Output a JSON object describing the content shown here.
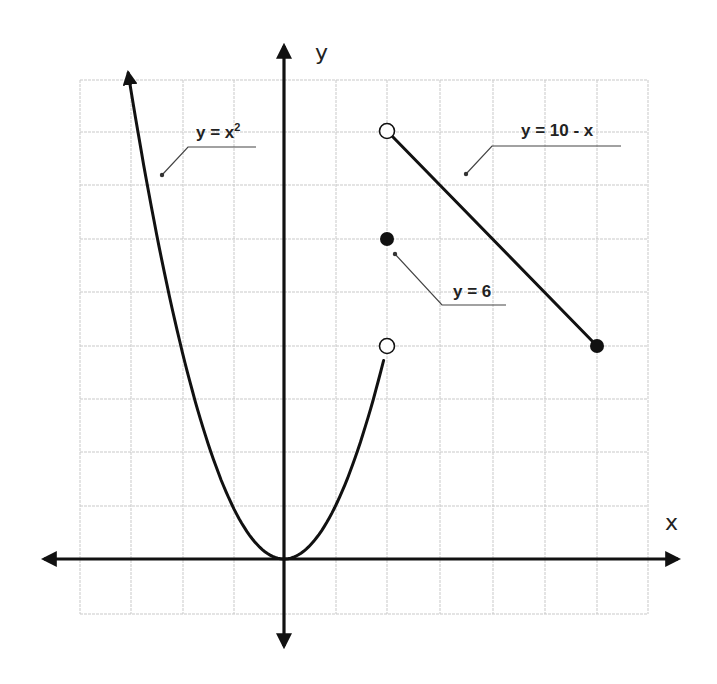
{
  "chart_data": {
    "type": "line",
    "title": "",
    "xlabel": "x",
    "ylabel": "y",
    "xlim": [
      -4,
      7
    ],
    "ylim": [
      -1,
      9
    ],
    "grid": true,
    "grid_step": 1,
    "tick_labels": "none",
    "series": [
      {
        "name": "y = x²",
        "label": "y = x²",
        "type": "curve",
        "domain": "x < 2",
        "points": [
          [
            -3,
            9
          ],
          [
            -2,
            4
          ],
          [
            -1,
            1
          ],
          [
            0,
            0
          ],
          [
            1,
            1
          ],
          [
            2,
            4
          ]
        ],
        "left_end": "arrow",
        "right_end": {
          "x": 2,
          "y": 4,
          "marker": "open-circle"
        }
      },
      {
        "name": "y = 6",
        "label": "y = 6",
        "type": "point",
        "domain": "x = 2",
        "points": [
          [
            2,
            6
          ]
        ],
        "marker": "filled-circle"
      },
      {
        "name": "y = 10 - x",
        "label": "y = 10 - x",
        "type": "segment",
        "domain": "2 < x ≤ 6",
        "points": [
          [
            2,
            8
          ],
          [
            6,
            4
          ]
        ],
        "left_end": {
          "x": 2,
          "y": 8,
          "marker": "open-circle"
        },
        "right_end": {
          "x": 6,
          "y": 4,
          "marker": "filled-circle"
        }
      }
    ],
    "annotations": [
      {
        "text": "y = x²",
        "points_to": "parabola left branch"
      },
      {
        "text": "y = 10 - x",
        "points_to": "line segment"
      },
      {
        "text": "y = 6",
        "points_to": "point (2, 6)"
      }
    ]
  },
  "labels": {
    "x_axis": "x",
    "y_axis": "y",
    "parabola_main": "y = x",
    "parabola_sup": "2",
    "line": "y = 10 - x",
    "point": "y = 6"
  },
  "colors": {
    "ink": "#111111",
    "grid": "#c9c9c9",
    "background": "#ffffff"
  }
}
